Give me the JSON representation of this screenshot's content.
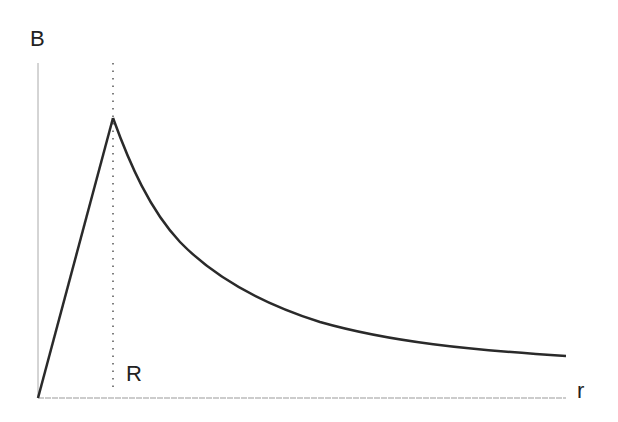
{
  "diagram": {
    "y_axis_label": "B",
    "x_axis_label": "r",
    "marker_label": "R",
    "colors": {
      "curve": "#2a2a2a",
      "axis": "#999999",
      "marker": "#555555"
    },
    "points": {
      "origin": [
        38,
        398
      ],
      "peak": [
        113,
        118
      ],
      "curve_end": [
        566,
        356
      ],
      "axis_x_end": [
        566,
        398
      ],
      "axis_y_top": [
        38,
        63
      ]
    }
  }
}
